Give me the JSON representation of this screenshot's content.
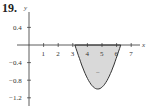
{
  "problem_number": "19.",
  "chart_data": {
    "type": "area",
    "title": "",
    "xlabel": "x",
    "ylabel": "y",
    "xlim": [
      0,
      7.5
    ],
    "ylim": [
      -1.4,
      0.6
    ],
    "x_ticks": [
      "1",
      "2",
      "3",
      "4",
      "5",
      "6",
      "7"
    ],
    "y_ticks": [
      "0.4",
      "-0.4",
      "-0.8",
      "-1.2"
    ],
    "curve": "y = sin x, π ≤ x ≤ 2π",
    "x": [
      3.14,
      3.5,
      3.93,
      4.3,
      4.71,
      5.1,
      5.5,
      5.9,
      6.28
    ],
    "values": [
      0,
      -0.35,
      -0.71,
      -0.92,
      -1.0,
      -0.93,
      -0.71,
      -0.37,
      0
    ],
    "region_sign": "−",
    "fill_color": "#d9d9d9",
    "grid": false
  }
}
